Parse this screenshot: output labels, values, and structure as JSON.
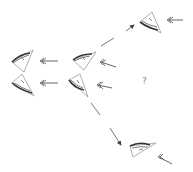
{
  "diagram": {
    "question_mark": "?",
    "colors": {
      "outline": "#9a9a9a",
      "stroke_dark": "#333333",
      "arrow": "#555555"
    },
    "nodes": [
      {
        "id": "left-upper-eye",
        "x": 10,
        "y": 50
      },
      {
        "id": "left-lower-eye",
        "x": 10,
        "y": 75
      },
      {
        "id": "middle-upper-eye",
        "x": 72,
        "y": 50
      },
      {
        "id": "middle-lower-eye",
        "x": 68,
        "y": 74
      },
      {
        "id": "top-right-eye",
        "x": 138,
        "y": 12
      },
      {
        "id": "bottom-right-eye",
        "x": 130,
        "y": 140
      }
    ]
  }
}
